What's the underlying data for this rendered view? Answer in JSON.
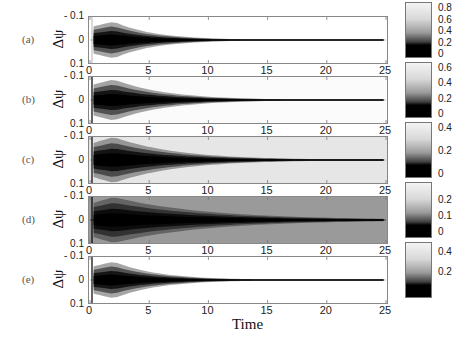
{
  "chart_data": {
    "type": "heatmap",
    "title": "",
    "xlabel": "Time",
    "ylabel": "Δψ",
    "xlim": [
      0,
      25
    ],
    "ylim": [
      -0.1,
      0.1
    ],
    "x_ticks": [
      "0",
      "5",
      "10",
      "15",
      "20",
      "25"
    ],
    "y_ticks": [
      "- 0.1",
      "0",
      "0.1"
    ],
    "colormap": "gray (black = low, white = high)",
    "panels": [
      {
        "label": "(a)",
        "colorbar_ticks": [
          "0.8",
          "0.6",
          "0.4",
          "0.2",
          "0"
        ],
        "colorbar_range": [
          0,
          0.85
        ],
        "background": "#ffffff",
        "peak_width": 0.8,
        "decay_time": 11
      },
      {
        "label": "(b)",
        "colorbar_ticks": [
          "0.6",
          "0.4",
          "0.2",
          "0"
        ],
        "colorbar_range": [
          0,
          0.65
        ],
        "background": "#fbfbfb",
        "peak_width": 0.9,
        "decay_time": 14
      },
      {
        "label": "(c)",
        "colorbar_ticks": [
          "0.4",
          "0.2",
          "0"
        ],
        "colorbar_range": [
          0,
          0.42
        ],
        "background": "#e6e6e6",
        "peak_width": 1.0,
        "decay_time": 17
      },
      {
        "label": "(d)",
        "colorbar_ticks": [
          "0.2",
          "0.1",
          "0"
        ],
        "colorbar_range": [
          0,
          0.28
        ],
        "background": "#9a9a9a",
        "peak_width": 1.0,
        "decay_time": 25
      },
      {
        "label": "(e)",
        "colorbar_ticks": [
          "0.4",
          "0.2"
        ],
        "colorbar_range": [
          0.1,
          0.45
        ],
        "background": "#ffffff",
        "peak_width": 0.8,
        "decay_time": 12
      }
    ]
  }
}
